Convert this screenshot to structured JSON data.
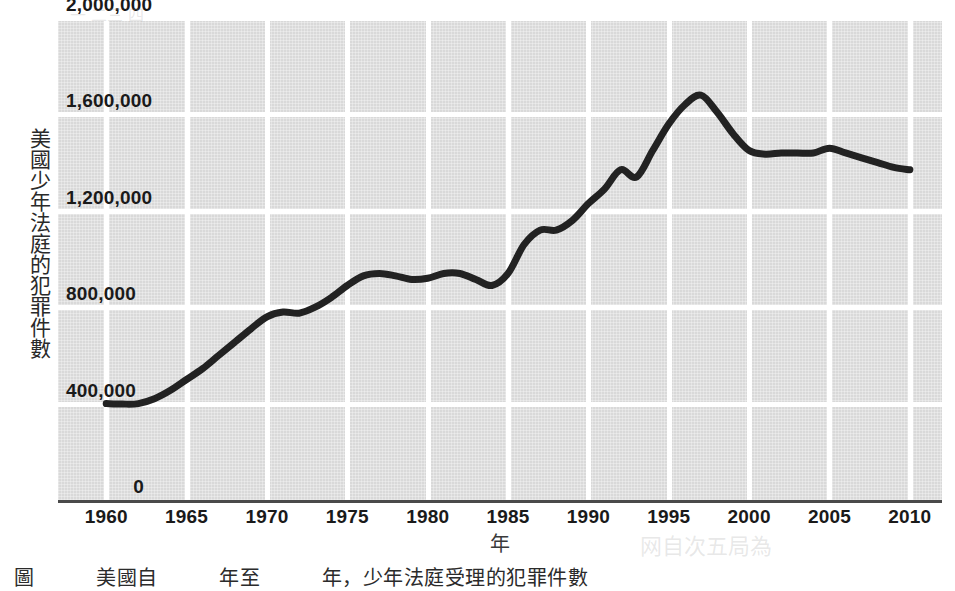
{
  "chart_data": {
    "type": "line",
    "title": "",
    "xlabel": "年",
    "ylabel": "美國少年法庭的犯罪件數",
    "xlim": [
      1957,
      2012
    ],
    "ylim": [
      0,
      2000000
    ],
    "grid": true,
    "legend": "none",
    "y_ticks": [
      "0",
      "400,000",
      "800,000",
      "1,200,000",
      "1,600,000",
      "2,000,000"
    ],
    "y_tick_values": [
      0,
      400000,
      800000,
      1200000,
      1600000,
      2000000
    ],
    "x_ticks": [
      "1960",
      "1965",
      "1970",
      "1975",
      "1980",
      "1985",
      "1990",
      "1995",
      "2000",
      "2005",
      "2010"
    ],
    "x_tick_values": [
      1960,
      1965,
      1970,
      1975,
      1980,
      1985,
      1990,
      1995,
      2000,
      2005,
      2010
    ],
    "series": [
      {
        "name": "美國少年法庭的犯罪件數",
        "color": "#222222",
        "x": [
          1960,
          1961,
          1962,
          1963,
          1964,
          1965,
          1966,
          1967,
          1968,
          1969,
          1970,
          1971,
          1972,
          1973,
          1974,
          1975,
          1976,
          1977,
          1978,
          1979,
          1980,
          1981,
          1982,
          1983,
          1984,
          1985,
          1986,
          1987,
          1988,
          1989,
          1990,
          1991,
          1992,
          1993,
          1994,
          1995,
          1996,
          1997,
          1998,
          1999,
          2000,
          2001,
          2002,
          2003,
          2004,
          2005,
          2006,
          2007,
          2008,
          2009,
          2010
        ],
        "y": [
          400000,
          398000,
          400000,
          420000,
          455000,
          500000,
          545000,
          600000,
          655000,
          710000,
          760000,
          780000,
          775000,
          800000,
          840000,
          890000,
          930000,
          940000,
          930000,
          915000,
          920000,
          940000,
          940000,
          915000,
          890000,
          940000,
          1060000,
          1120000,
          1120000,
          1160000,
          1230000,
          1290000,
          1370000,
          1340000,
          1450000,
          1560000,
          1640000,
          1680000,
          1610000,
          1520000,
          1450000,
          1435000,
          1440000,
          1440000,
          1440000,
          1460000,
          1440000,
          1420000,
          1400000,
          1380000,
          1370000
        ]
      }
    ]
  },
  "axis": {
    "y_title": "美國少年法庭的犯罪件數",
    "x_title": "年"
  },
  "caption": {
    "text": "圖　　　美國自　　　年至　　　年，少年法庭受理的犯罪件數"
  },
  "colors": {
    "plot_background": "#d9d9d9",
    "gridline": "#ffffff",
    "data_line": "#222222",
    "axis_line": "#4a4a4a",
    "text": "#1a1a1a"
  }
}
